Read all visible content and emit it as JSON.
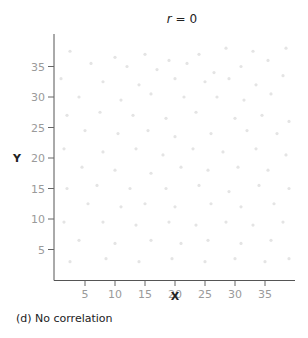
{
  "chart_data": {
    "type": "scatter",
    "title": "r = 0",
    "xlabel": "X",
    "ylabel": "Y",
    "caption": "(d) No correlation",
    "xlim": [
      0,
      40
    ],
    "ylim": [
      0,
      40
    ],
    "xticks": [
      5,
      10,
      15,
      20,
      25,
      30,
      35
    ],
    "yticks": [
      5,
      10,
      15,
      20,
      25,
      30,
      35
    ],
    "grid": false,
    "legend": null,
    "point_color": "#e4e4e4",
    "points": [
      [
        2.5,
        37.5
      ],
      [
        10,
        36.5
      ],
      [
        15,
        37
      ],
      [
        19,
        36
      ],
      [
        24,
        37
      ],
      [
        28.5,
        38
      ],
      [
        33,
        37.5
      ],
      [
        38.5,
        38
      ],
      [
        6,
        35.5
      ],
      [
        12,
        35
      ],
      [
        17,
        34.5
      ],
      [
        22,
        35.5
      ],
      [
        26.5,
        34
      ],
      [
        31,
        35
      ],
      [
        35.5,
        36
      ],
      [
        1,
        33
      ],
      [
        8,
        32.5
      ],
      [
        14,
        32
      ],
      [
        20,
        33
      ],
      [
        25,
        32.5
      ],
      [
        29,
        33
      ],
      [
        33.5,
        32
      ],
      [
        38,
        33.5
      ],
      [
        4,
        30
      ],
      [
        11,
        29.5
      ],
      [
        16,
        30.5
      ],
      [
        21.5,
        30
      ],
      [
        27,
        30
      ],
      [
        31.5,
        29.5
      ],
      [
        36,
        30.5
      ],
      [
        2,
        27
      ],
      [
        7.5,
        27.5
      ],
      [
        13,
        27
      ],
      [
        18.5,
        26.5
      ],
      [
        23.5,
        27.5
      ],
      [
        30,
        26.5
      ],
      [
        34.5,
        27
      ],
      [
        39,
        26
      ],
      [
        5,
        24.5
      ],
      [
        10.5,
        24
      ],
      [
        15.5,
        24.5
      ],
      [
        20,
        23.5
      ],
      [
        26,
        24
      ],
      [
        32,
        24.5
      ],
      [
        37,
        24
      ],
      [
        1.5,
        21.5
      ],
      [
        8,
        21
      ],
      [
        13.5,
        21.5
      ],
      [
        18,
        20.5
      ],
      [
        23,
        21.5
      ],
      [
        28,
        21
      ],
      [
        33.5,
        21.5
      ],
      [
        38.5,
        20.5
      ],
      [
        4.5,
        18.5
      ],
      [
        10,
        18
      ],
      [
        16,
        17.5
      ],
      [
        21,
        18.5
      ],
      [
        25.5,
        18
      ],
      [
        30.5,
        18.5
      ],
      [
        35.5,
        18
      ],
      [
        2,
        15
      ],
      [
        7,
        15.5
      ],
      [
        12.5,
        15
      ],
      [
        18.5,
        15
      ],
      [
        24,
        15.5
      ],
      [
        29,
        14.5
      ],
      [
        34,
        15.5
      ],
      [
        39,
        15
      ],
      [
        5.5,
        12.5
      ],
      [
        11,
        12
      ],
      [
        15,
        12.5
      ],
      [
        20,
        12
      ],
      [
        26,
        12.5
      ],
      [
        31,
        12
      ],
      [
        36.5,
        12.5
      ],
      [
        1.5,
        9.5
      ],
      [
        8,
        9.5
      ],
      [
        13.5,
        9
      ],
      [
        19,
        9.5
      ],
      [
        23.5,
        9
      ],
      [
        28.5,
        9.5
      ],
      [
        33,
        9
      ],
      [
        38,
        9.5
      ],
      [
        4,
        6.5
      ],
      [
        10,
        6
      ],
      [
        16,
        6.5
      ],
      [
        21,
        6
      ],
      [
        25.5,
        6.5
      ],
      [
        31,
        6
      ],
      [
        36,
        6.5
      ],
      [
        2.5,
        3
      ],
      [
        8.5,
        3.5
      ],
      [
        14,
        3
      ],
      [
        19.5,
        3.5
      ],
      [
        25,
        3
      ],
      [
        30,
        3.5
      ],
      [
        35,
        3
      ],
      [
        39,
        3.5
      ]
    ]
  }
}
